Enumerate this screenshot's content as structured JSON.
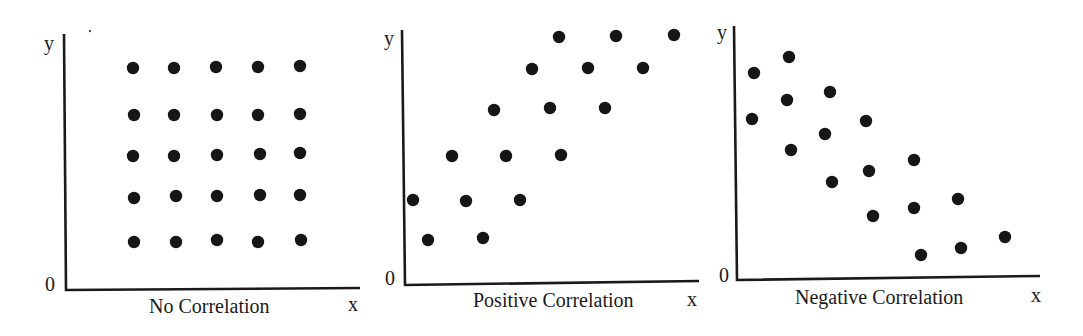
{
  "figure": {
    "panels": [
      {
        "title": "No Correlation",
        "x_label": "x",
        "y_label": "y",
        "origin_label": "0"
      },
      {
        "title": "Positive Correlation",
        "x_label": "x",
        "y_label": "y",
        "origin_label": "0"
      },
      {
        "title": "Negative Correlation",
        "x_label": "x",
        "y_label": "y",
        "origin_label": "0"
      }
    ]
  },
  "chart_data": [
    {
      "type": "scatter",
      "title": "No Correlation",
      "xlabel": "x",
      "ylabel": "y",
      "origin_label": "0",
      "grid": false,
      "axes_px": {
        "x0": 65,
        "y0": 290,
        "x_end": 360,
        "y_top": 34
      },
      "points_px": [
        [
          133,
          68
        ],
        [
          174,
          68
        ],
        [
          216,
          67
        ],
        [
          258,
          67
        ],
        [
          300,
          66
        ],
        [
          134,
          115
        ],
        [
          174,
          115
        ],
        [
          217,
          115
        ],
        [
          258,
          115
        ],
        [
          300,
          114
        ],
        [
          133,
          156
        ],
        [
          174,
          156
        ],
        [
          217,
          155
        ],
        [
          260,
          154
        ],
        [
          300,
          153
        ],
        [
          134,
          198
        ],
        [
          176,
          196
        ],
        [
          217,
          196
        ],
        [
          260,
          195
        ],
        [
          300,
          195
        ],
        [
          134,
          242
        ],
        [
          176,
          242
        ],
        [
          217,
          240
        ],
        [
          258,
          242
        ],
        [
          301,
          240
        ]
      ]
    },
    {
      "type": "scatter",
      "title": "Positive Correlation",
      "xlabel": "x",
      "ylabel": "y",
      "origin_label": "0",
      "grid": false,
      "axes_px": {
        "x0": 404,
        "y0": 284,
        "x_end": 700,
        "y_top": 30
      },
      "points_px": [
        [
          413,
          200
        ],
        [
          428,
          240
        ],
        [
          452,
          156
        ],
        [
          466,
          201
        ],
        [
          483,
          238
        ],
        [
          494,
          110
        ],
        [
          506,
          156
        ],
        [
          520,
          200
        ],
        [
          532,
          69
        ],
        [
          550,
          108
        ],
        [
          559,
          37
        ],
        [
          561,
          155
        ],
        [
          588,
          68
        ],
        [
          605,
          108
        ],
        [
          616,
          36
        ],
        [
          643,
          68
        ],
        [
          674,
          35
        ]
      ]
    },
    {
      "type": "scatter",
      "title": "Negative Correlation",
      "xlabel": "x",
      "ylabel": "y",
      "origin_label": "0",
      "grid": false,
      "axes_px": {
        "x0": 736,
        "y0": 279,
        "x_end": 1040,
        "y_top": 26
      },
      "points_px": [
        [
          754,
          73
        ],
        [
          789,
          57
        ],
        [
          752,
          119
        ],
        [
          787,
          100
        ],
        [
          830,
          92
        ],
        [
          791,
          150
        ],
        [
          825,
          134
        ],
        [
          866,
          121
        ],
        [
          832,
          182
        ],
        [
          869,
          171
        ],
        [
          914,
          160
        ],
        [
          873,
          216
        ],
        [
          914,
          208
        ],
        [
          958,
          199
        ],
        [
          921,
          255
        ],
        [
          961,
          248
        ],
        [
          1005,
          237
        ]
      ]
    }
  ]
}
